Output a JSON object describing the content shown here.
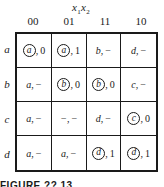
{
  "title": {
    "var1": "x",
    "sub1": "1",
    "var2": "x",
    "sub2": "2"
  },
  "columns": [
    "00",
    "01",
    "11",
    "10"
  ],
  "rows": [
    {
      "label": "a",
      "cells": [
        {
          "state": "a",
          "stable": true,
          "output": "0"
        },
        {
          "state": "a",
          "stable": true,
          "output": "1"
        },
        {
          "state": "b",
          "stable": false,
          "output": "−"
        },
        {
          "state": "d",
          "stable": false,
          "output": "−"
        }
      ]
    },
    {
      "label": "b",
      "cells": [
        {
          "state": "a",
          "stable": false,
          "output": "−"
        },
        {
          "state": "b",
          "stable": true,
          "output": "0"
        },
        {
          "state": "b",
          "stable": true,
          "output": "0"
        },
        {
          "state": "c",
          "stable": false,
          "output": "−"
        }
      ]
    },
    {
      "label": "c",
      "cells": [
        {
          "state": "a",
          "stable": false,
          "output": "−"
        },
        {
          "state": "−",
          "stable": false,
          "output": "−"
        },
        {
          "state": "d",
          "stable": false,
          "output": "−"
        },
        {
          "state": "c",
          "stable": true,
          "output": "0"
        }
      ]
    },
    {
      "label": "d",
      "cells": [
        {
          "state": "a",
          "stable": false,
          "output": "−"
        },
        {
          "state": "a",
          "stable": false,
          "output": "−"
        },
        {
          "state": "d",
          "stable": true,
          "output": "1"
        },
        {
          "state": "d",
          "stable": true,
          "output": "1"
        }
      ]
    }
  ],
  "caption": "FIGURE ??.13"
}
